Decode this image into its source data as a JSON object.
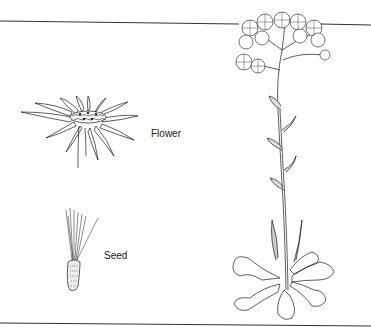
{
  "diagram": {
    "labels": {
      "flower": "Flower",
      "seed": "Seed"
    },
    "parts": [
      {
        "name": "flower",
        "label": "Flower",
        "description": "Flower head with ray petals and central disc"
      },
      {
        "name": "seed",
        "label": "Seed",
        "description": "Seed (achene) with pappus bristles"
      },
      {
        "name": "whole-plant",
        "label": "",
        "description": "Full plant with clustered flower heads, stem leaves and basal rosette"
      }
    ],
    "colors": {
      "line": "#1a1a1a",
      "background": "#ffffff",
      "border": "#333333"
    }
  }
}
